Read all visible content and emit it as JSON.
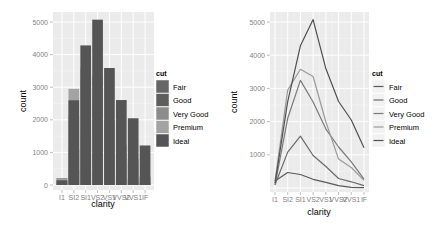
{
  "chart_data": [
    {
      "type": "bar",
      "position": "identity (overlapping)",
      "xlabel": "clarity",
      "ylabel": "count",
      "categories": [
        "I1",
        "SI2",
        "SI1",
        "VS2",
        "VS1",
        "VVS2",
        "VVS1",
        "IF"
      ],
      "yticks": [
        0,
        1000,
        2000,
        3000,
        4000,
        5000
      ],
      "ylim": [
        0,
        5300
      ],
      "grid": true,
      "legend": {
        "title": "cut",
        "position": "right",
        "entries": [
          "Fair",
          "Good",
          "Very Good",
          "Premium",
          "Ideal"
        ]
      },
      "series": [
        {
          "name": "Fair",
          "color": "#666666",
          "values": [
            210,
            466,
            408,
            261,
            170,
            69,
            17,
            9
          ]
        },
        {
          "name": "Good",
          "color": "#5e5e5e",
          "values": [
            96,
            1081,
            1560,
            978,
            648,
            286,
            186,
            71
          ]
        },
        {
          "name": "Very Good",
          "color": "#8c8c8c",
          "values": [
            84,
            2100,
            3240,
            2591,
            1775,
            1235,
            789,
            268
          ]
        },
        {
          "name": "Premium",
          "color": "#a3a3a3",
          "values": [
            205,
            2949,
            3575,
            3357,
            1989,
            870,
            616,
            230
          ]
        },
        {
          "name": "Ideal",
          "color": "#555555",
          "values": [
            146,
            2598,
            4282,
            5071,
            3589,
            2606,
            2047,
            1212
          ]
        }
      ]
    },
    {
      "type": "line",
      "xlabel": "clarity",
      "ylabel": "count",
      "categories": [
        "I1",
        "SI2",
        "SI1",
        "VS2",
        "VS1",
        "VVS2",
        "VVS1",
        "IF"
      ],
      "yticks": [
        1000,
        2000,
        3000,
        4000,
        5000
      ],
      "ylim": [
        0,
        5300
      ],
      "grid": true,
      "legend": {
        "title": "cut",
        "position": "right",
        "entries": [
          "Fair",
          "Good",
          "Very Good",
          "Premium",
          "Ideal"
        ]
      },
      "series": [
        {
          "name": "Fair",
          "color": "#5a5a5a",
          "values": [
            210,
            466,
            408,
            261,
            170,
            69,
            17,
            9
          ]
        },
        {
          "name": "Good",
          "color": "#6a6a6a",
          "values": [
            96,
            1081,
            1560,
            978,
            648,
            286,
            186,
            71
          ]
        },
        {
          "name": "Very Good",
          "color": "#7a7a7a",
          "values": [
            84,
            2100,
            3240,
            2591,
            1775,
            1235,
            789,
            268
          ]
        },
        {
          "name": "Premium",
          "color": "#9a9a9a",
          "values": [
            205,
            2949,
            3575,
            3357,
            1989,
            870,
            616,
            230
          ]
        },
        {
          "name": "Ideal",
          "color": "#505050",
          "values": [
            146,
            2598,
            4282,
            5071,
            3589,
            2606,
            2047,
            1212
          ]
        }
      ]
    }
  ],
  "left_panel": {
    "xlabel": "clarity",
    "ylabel": "count",
    "legend_title": "cut",
    "legend": [
      "Fair",
      "Good",
      "Very Good",
      "Premium",
      "Ideal"
    ]
  },
  "right_panel": {
    "xlabel": "clarity",
    "ylabel": "count",
    "legend_title": "cut",
    "legend": [
      "Fair",
      "Good",
      "Very Good",
      "Premium",
      "Ideal"
    ]
  }
}
